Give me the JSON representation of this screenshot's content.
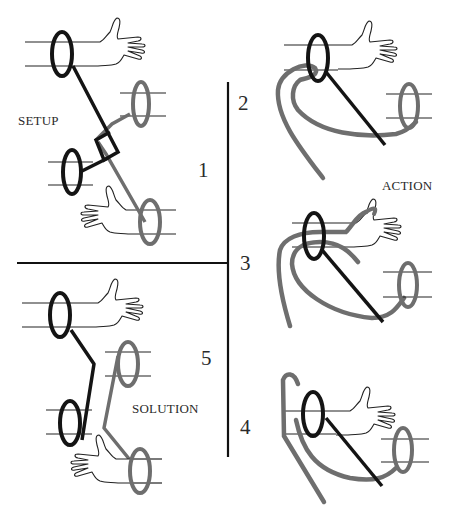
{
  "figure": {
    "labels": {
      "setup": "SETUP",
      "action": "ACTION",
      "solution": "SOLUTION"
    },
    "steps": {
      "s1": "1",
      "s2": "2",
      "s3": "3",
      "s4": "4",
      "s5": "5"
    },
    "colors": {
      "black_cord": "#141414",
      "gray_cord": "#6e6e6e",
      "outline": "#222222",
      "background": "#ffffff"
    },
    "panels": [
      {
        "id": "setup",
        "step": "1",
        "description": "Two wrists each bound by a black ring and a gray ring, cords crossed and interlocked"
      },
      {
        "id": "action-2",
        "step": "2",
        "description": "Gray cord loop passed up through the black wrist ring"
      },
      {
        "id": "action-3",
        "step": "3",
        "description": "Gray loop passed over the hand"
      },
      {
        "id": "action-4",
        "step": "4",
        "description": "Gray loop pulled back under the ring, cords separating"
      },
      {
        "id": "solution",
        "step": "5",
        "description": "Black and gray cords separated"
      }
    ]
  }
}
